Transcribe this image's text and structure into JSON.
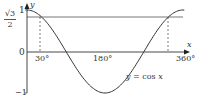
{
  "chart_data": {
    "type": "line",
    "title": "",
    "xlabel": "x",
    "ylabel": "y",
    "series": [
      {
        "name": "y = cos x",
        "x": [
          0,
          30,
          60,
          90,
          120,
          150,
          180,
          210,
          240,
          270,
          300,
          330,
          360
        ],
        "values": [
          1,
          0.866,
          0.5,
          0,
          -0.5,
          -0.866,
          -1,
          -0.866,
          -0.5,
          0,
          0.5,
          0.866,
          1
        ]
      },
      {
        "name": "y = √3/2",
        "x": [
          0,
          360
        ],
        "values": [
          0.866,
          0.866
        ]
      }
    ],
    "x_ticks": [
      "30°",
      "180°",
      "360°"
    ],
    "y_ticks": [
      "1",
      "√3/2",
      "0",
      "−1"
    ],
    "annotations": [
      {
        "type": "dashed-vertical",
        "x": 30,
        "from": 0,
        "to": 0.866
      },
      {
        "type": "dashed-vertical",
        "x": 330,
        "from": 0,
        "to": 0.866
      }
    ],
    "xlim": [
      0,
      360
    ],
    "ylim": [
      -1,
      1
    ],
    "grid": false,
    "curve_label": "y = cos x"
  },
  "labels": {
    "y_axis": "y",
    "x_axis": "x",
    "y_one": "1",
    "y_zero": "0",
    "y_minus_one": "−1",
    "root3_num": "√3",
    "root3_den": "2",
    "x_30": "30°",
    "x_180": "180°",
    "x_360": "360°",
    "curve_eq_y": "y",
    "curve_eq_mid": " = cos ",
    "curve_eq_x": "x"
  }
}
